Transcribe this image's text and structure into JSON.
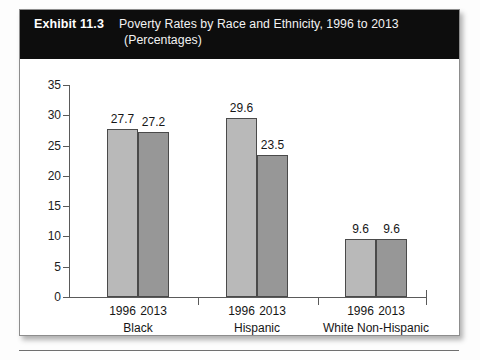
{
  "exhibit": {
    "number": "Exhibit 11.3",
    "title": "Poverty Rates by Race and Ethnicity, 1996 to 2013",
    "subtitle": "(Percentages)"
  },
  "chart_data": {
    "type": "bar",
    "title": "Poverty Rates by Race and Ethnicity, 1996 to 2013",
    "subtitle": "(Percentages)",
    "xlabel": "",
    "ylabel": "",
    "ylim": [
      0,
      35
    ],
    "ytick_labels": [
      "35",
      "30",
      "25",
      "20",
      "15",
      "10",
      "5",
      "0"
    ],
    "ytick_values": [
      35,
      30,
      25,
      20,
      15,
      10,
      5,
      0
    ],
    "grid": false,
    "legend": "none",
    "categories": [
      "Black",
      "Hispanic",
      "White Non-Hispanic"
    ],
    "series": [
      {
        "name": "1996",
        "values": [
          27.7,
          29.6,
          9.6
        ],
        "color": "#b9b9b9"
      },
      {
        "name": "2013",
        "values": [
          27.2,
          23.5,
          9.6
        ],
        "color": "#979797"
      }
    ],
    "groups": [
      {
        "category": "Black",
        "bars": [
          {
            "year": "1996",
            "value": 27.7,
            "label": "27.7"
          },
          {
            "year": "2013",
            "value": 27.2,
            "label": "27.2"
          }
        ]
      },
      {
        "category": "Hispanic",
        "bars": [
          {
            "year": "1996",
            "value": 29.6,
            "label": "29.6"
          },
          {
            "year": "2013",
            "value": 23.5,
            "label": "23.5"
          }
        ]
      },
      {
        "category": "White Non-Hispanic",
        "bars": [
          {
            "year": "1996",
            "value": 9.6,
            "label": "9.6"
          },
          {
            "year": "2013",
            "value": 9.6,
            "label": "9.6"
          }
        ]
      }
    ]
  }
}
